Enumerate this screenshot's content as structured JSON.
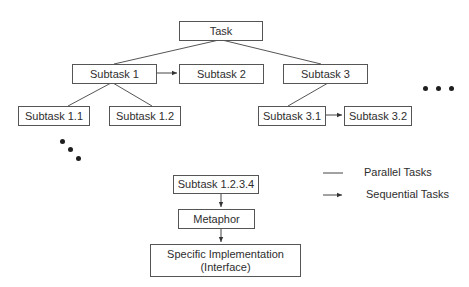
{
  "diagram": {
    "root": {
      "label": "Task"
    },
    "level1": [
      {
        "label": "Subtask 1"
      },
      {
        "label": "Subtask 2"
      },
      {
        "label": "Subtask 3"
      }
    ],
    "level2": [
      {
        "label": "Subtask 1.1"
      },
      {
        "label": "Subtask 1.2"
      },
      {
        "label": "Subtask 3.1"
      },
      {
        "label": "Subtask 3.2"
      }
    ],
    "chain": [
      {
        "label": "Subtask 1.2.3.4"
      },
      {
        "label": "Metaphor"
      },
      {
        "label_line1": "Specific Implementation",
        "label_line2": "(Interface)"
      }
    ],
    "legend": {
      "parallel": "Parallel Tasks",
      "sequential": "Sequential Tasks"
    },
    "ellipsis_icons": [
      "horizontal-ellipsis",
      "diagonal-ellipsis"
    ],
    "colors": {
      "line": "#555555",
      "text": "#2e2e2e",
      "dots": "#1e1e1e"
    }
  }
}
